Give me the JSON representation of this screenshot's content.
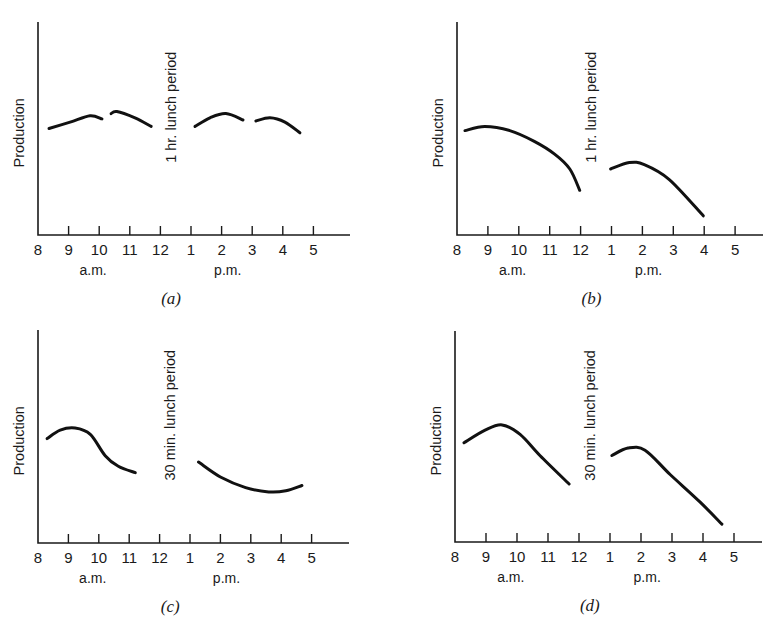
{
  "chart_data": [
    {
      "type": "line",
      "panel": "a",
      "caption": "(a)",
      "ylabel": "Production",
      "xlabel": "",
      "annotation": "1 hr. lunch period",
      "x_tick_labels": [
        "8",
        "9",
        "10",
        "11",
        "12",
        "1",
        "2",
        "3",
        "4",
        "5"
      ],
      "x_ticks_hours24": [
        8,
        9,
        10,
        11,
        12,
        13,
        14,
        15,
        16,
        17
      ],
      "period_labels": [
        "a.m.",
        "p.m."
      ],
      "xlim": [
        8,
        18.2
      ],
      "ylim": [
        0,
        100
      ],
      "grid": false,
      "layout": {
        "ox": 38,
        "oy": 235,
        "top": 22,
        "xend": 350,
        "spacing": 30.6
      },
      "series": [
        {
          "name": "early morning",
          "points": [
            [
              8.36,
              50
            ],
            [
              9.05,
              53
            ],
            [
              9.7,
              56
            ],
            [
              10.09,
              54.5
            ]
          ]
        },
        {
          "name": "late morning",
          "points": [
            [
              10.39,
              57
            ],
            [
              10.58,
              58
            ],
            [
              11.17,
              55
            ],
            [
              11.7,
              51
            ]
          ]
        },
        {
          "name": "early afternoon",
          "points": [
            [
              13.13,
              51
            ],
            [
              13.62,
              55
            ],
            [
              14.14,
              57
            ],
            [
              14.7,
              54
            ]
          ]
        },
        {
          "name": "late afternoon",
          "points": [
            [
              15.12,
              53.5
            ],
            [
              15.58,
              55
            ],
            [
              16.07,
              53
            ],
            [
              16.56,
              48
            ]
          ]
        }
      ]
    },
    {
      "type": "line",
      "panel": "b",
      "caption": "(b)",
      "ylabel": "Production",
      "xlabel": "",
      "annotation": "1 hr. lunch period",
      "x_tick_labels": [
        "8",
        "9",
        "10",
        "11",
        "12",
        "1",
        "2",
        "3",
        "4",
        "5"
      ],
      "x_ticks_hours24": [
        8,
        9,
        10,
        11,
        12,
        13,
        14,
        15,
        16,
        17
      ],
      "period_labels": [
        "a.m.",
        "p.m."
      ],
      "xlim": [
        8,
        17.9
      ],
      "ylim": [
        0,
        100
      ],
      "grid": false,
      "layout": {
        "ox": 457,
        "oy": 235,
        "top": 22,
        "xend": 763,
        "spacing": 30.9
      },
      "series": [
        {
          "name": "morning",
          "points": [
            [
              8.26,
              49
            ],
            [
              8.9,
              51
            ],
            [
              9.71,
              49
            ],
            [
              10.5,
              44
            ],
            [
              11.16,
              38
            ],
            [
              11.65,
              31
            ],
            [
              11.97,
              21
            ]
          ]
        },
        {
          "name": "afternoon",
          "points": [
            [
              12.97,
              31
            ],
            [
              13.58,
              34
            ],
            [
              14.06,
              33
            ],
            [
              14.87,
              26
            ],
            [
              15.97,
              9
            ]
          ]
        }
      ]
    },
    {
      "type": "line",
      "panel": "c",
      "caption": "(c)",
      "ylabel": "Production",
      "xlabel": "",
      "annotation": "30 min. lunch period",
      "x_tick_labels": [
        "8",
        "9",
        "10",
        "11",
        "12",
        "1",
        "2",
        "3",
        "4",
        "5"
      ],
      "x_ticks_hours24": [
        8,
        9,
        10,
        11,
        12,
        13,
        14,
        15,
        16,
        17
      ],
      "period_labels": [
        "a.m.",
        "p.m."
      ],
      "xlim": [
        8,
        18.2
      ],
      "ylim": [
        0,
        100
      ],
      "grid": false,
      "layout": {
        "ox": 38,
        "oy": 543,
        "top": 330,
        "xend": 349,
        "spacing": 30.4
      },
      "series": [
        {
          "name": "morning",
          "points": [
            [
              8.3,
              49
            ],
            [
              8.73,
              53
            ],
            [
              9.22,
              54
            ],
            [
              9.72,
              51
            ],
            [
              10.21,
              41
            ],
            [
              10.64,
              36
            ],
            [
              11.2,
              33
            ]
          ]
        },
        {
          "name": "afternoon",
          "points": [
            [
              13.28,
              38
            ],
            [
              14.0,
              31
            ],
            [
              14.83,
              26
            ],
            [
              15.59,
              24
            ],
            [
              16.15,
              24.5
            ],
            [
              16.68,
              27
            ]
          ]
        }
      ]
    },
    {
      "type": "line",
      "panel": "d",
      "caption": "(d)",
      "ylabel": "Production",
      "xlabel": "",
      "annotation": "30 min. lunch period",
      "x_tick_labels": [
        "8",
        "9",
        "10",
        "11",
        "12",
        "1",
        "2",
        "3",
        "4",
        "5"
      ],
      "x_ticks_hours24": [
        8,
        9,
        10,
        11,
        12,
        13,
        14,
        15,
        16,
        17
      ],
      "period_labels": [
        "a.m.",
        "p.m."
      ],
      "xlim": [
        8,
        17.9
      ],
      "ylim": [
        0,
        100
      ],
      "grid": false,
      "layout": {
        "ox": 455,
        "oy": 542,
        "top": 331,
        "xend": 762,
        "spacing": 31.0
      },
      "series": [
        {
          "name": "morning",
          "points": [
            [
              8.29,
              47
            ],
            [
              8.97,
              53
            ],
            [
              9.52,
              55.5
            ],
            [
              10.1,
              51
            ],
            [
              10.74,
              41
            ],
            [
              11.68,
              27.5
            ]
          ]
        },
        {
          "name": "afternoon",
          "points": [
            [
              13.06,
              41
            ],
            [
              13.58,
              44.5
            ],
            [
              14.13,
              43.5
            ],
            [
              14.94,
              32
            ],
            [
              15.9,
              19
            ],
            [
              16.61,
              8.5
            ]
          ]
        }
      ]
    }
  ]
}
